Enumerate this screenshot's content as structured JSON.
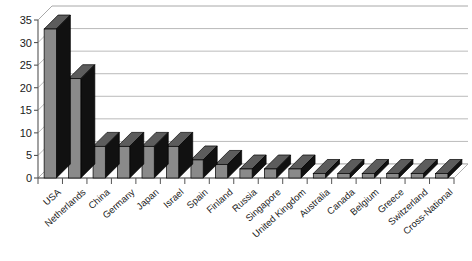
{
  "chart_data": {
    "type": "bar",
    "title": "",
    "subtitle": "",
    "xlabel": "",
    "ylabel": "",
    "ylim": [
      0,
      35
    ],
    "ytick_step": 5,
    "yticks": [
      0,
      5,
      10,
      15,
      20,
      25,
      30,
      35
    ],
    "ytick_labels": [
      "0",
      "5",
      "10",
      "15",
      "20",
      "25",
      "30",
      "35"
    ],
    "grid": true,
    "grid_axis": "y",
    "legend": false,
    "legend_position": "none",
    "style": "3d-column",
    "categories": [
      "USA",
      "Netherlands",
      "China",
      "Germany",
      "Japan",
      "Israel",
      "Spain",
      "Finland",
      "Russia",
      "Singapore",
      "United Kingdom",
      "Australia",
      "Canada",
      "Belgium",
      "Greece",
      "Switzerland",
      "Cross-National"
    ],
    "values": [
      33,
      22,
      7,
      7,
      7,
      7,
      4,
      3,
      2,
      2,
      2,
      1,
      1,
      1,
      1,
      1,
      1
    ],
    "series": [
      {
        "name": "Series 1",
        "values": [
          33,
          22,
          7,
          7,
          7,
          7,
          4,
          3,
          2,
          2,
          2,
          1,
          1,
          1,
          1,
          1,
          1
        ]
      }
    ]
  },
  "colors": {
    "bar_front": "#8a8a8a",
    "bar_side": "#111111",
    "bar_top": "#5c5c5c",
    "bar_outline": "#000000",
    "gridline": "#a8a8a8",
    "axis": "#555555",
    "floor": "#fdfdfd",
    "background": "#ffffff",
    "text": "#1a1a1a"
  }
}
